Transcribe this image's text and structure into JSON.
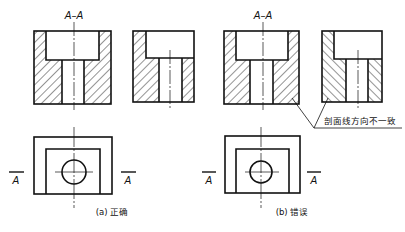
{
  "figure": {
    "panel_a": {
      "section_title": "A–A",
      "marker_left": "A",
      "marker_right": "A",
      "caption": "(a) 正确"
    },
    "panel_b": {
      "section_title": "A–A",
      "marker_left": "A",
      "marker_right": "A",
      "caption": "(b) 错误",
      "annotation": "剖面线方向不一致"
    }
  },
  "colors": {
    "line": "#111111",
    "background": "#ffffff"
  }
}
